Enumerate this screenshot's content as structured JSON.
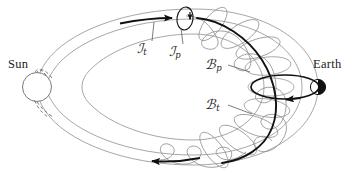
{
  "figure": {
    "name": "sun-earth-flux-rope-diagram",
    "background_color": "#ffffff",
    "ink_color": "#1a1a1a",
    "thin_line_color": "#8a8a8a",
    "width": 360,
    "height": 174
  },
  "labels": {
    "sun": "Sun",
    "earth": "Earth",
    "current_toroidal": {
      "symbol": "ℐ",
      "subscript": "t"
    },
    "current_poloidal": {
      "symbol": "ℐ",
      "subscript": "p"
    },
    "field_poloidal": {
      "symbol": "ℬ",
      "subscript": "p"
    },
    "field_toroidal": {
      "symbol": "ℬ",
      "subscript": "t"
    }
  },
  "bodies": {
    "sun": {
      "name": "sun-disc",
      "fill": "none",
      "stroke": "#6b6b6b",
      "cx": 37,
      "cy": 87,
      "r": 15
    },
    "earth": {
      "name": "earth-disc",
      "fill_right_half": "#111111",
      "fill_left_half": "#ffffff",
      "stroke": "#111111",
      "cx": 318,
      "cy": 87,
      "r": 8
    }
  },
  "annotations": {
    "leader_lines": 4,
    "arrow_count": 4,
    "dashed_segments": 2
  }
}
